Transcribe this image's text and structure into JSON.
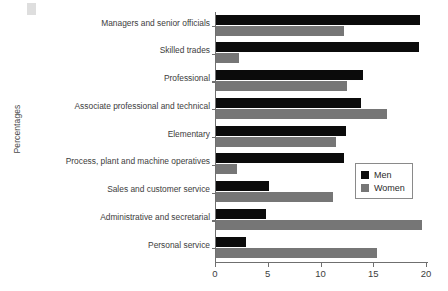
{
  "figure": {
    "corner_marker_icon": "square-marker-icon",
    "caption": ""
  },
  "legend": {
    "position": "inside-right-lower",
    "entries": [
      {
        "label": "Men",
        "color": "#0b0b0b"
      },
      {
        "label": "Women",
        "color": "#767676"
      }
    ]
  },
  "axes": {
    "ylabel": "Percentages",
    "xlabel": "",
    "xticks": [
      "0",
      "5",
      "10",
      "15",
      "20"
    ],
    "xlim": [
      0,
      20
    ],
    "grid": false
  },
  "chart_data": {
    "type": "bar",
    "orientation": "horizontal",
    "title": "",
    "xlabel": "",
    "ylabel": "Percentages",
    "xlim": [
      0,
      20
    ],
    "grid": false,
    "legend_position": "inside-right-lower",
    "categories": [
      "Managers and senior officials",
      "Skilled trades",
      "Professional",
      "Associate professional and technical",
      "Elementary",
      "Process, plant and machine operatives",
      "Sales and customer service",
      "Administrative and secretarial",
      "Personal service"
    ],
    "series": [
      {
        "name": "Men",
        "color": "#0b0b0b",
        "values": [
          19.3,
          19.2,
          13.9,
          13.7,
          12.3,
          12.1,
          5.0,
          4.7,
          2.8
        ]
      },
      {
        "name": "Women",
        "color": "#767676",
        "values": [
          12.1,
          2.2,
          12.4,
          16.2,
          11.4,
          2.0,
          11.1,
          19.5,
          15.3
        ]
      }
    ]
  }
}
